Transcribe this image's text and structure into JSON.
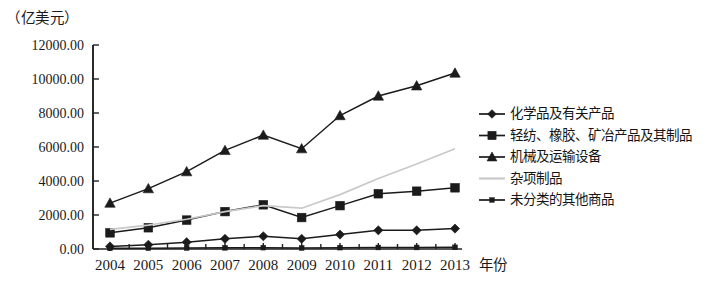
{
  "axis": {
    "unit_label": "（亿美元）",
    "xlabel": "年份",
    "ytick_labels": [
      "0.00",
      "2000.00",
      "4000.00",
      "6000.00",
      "8000.00",
      "10000.00",
      "12000.00"
    ],
    "xtick_labels": [
      "2004",
      "2005",
      "2006",
      "2007",
      "2008",
      "2009",
      "2010",
      "2011",
      "2012",
      "2013"
    ]
  },
  "legend": {
    "items": [
      {
        "label": "化学品及有关产品",
        "marker": "diamond-marker",
        "color": "#1b1b1b"
      },
      {
        "label": "轻纺、橡胶、矿冶产品及其制品",
        "marker": "square-marker",
        "color": "#1b1b1b"
      },
      {
        "label": "机械及运输设备",
        "marker": "triangle-marker",
        "color": "#1b1b1b"
      },
      {
        "label": "杂项制品",
        "marker": "line-marker",
        "color": "#c9c9c9"
      },
      {
        "label": "未分类的其他商品",
        "marker": "small-square-marker",
        "color": "#1b1b1b"
      }
    ]
  },
  "chart_data": {
    "type": "line",
    "title": "",
    "subtitle": "",
    "xlabel": "年份",
    "ylabel": "（亿美元）",
    "x": [
      "2004",
      "2005",
      "2006",
      "2007",
      "2008",
      "2009",
      "2010",
      "2011",
      "2012",
      "2013"
    ],
    "categories": [
      "2004",
      "2005",
      "2006",
      "2007",
      "2008",
      "2009",
      "2010",
      "2011",
      "2012",
      "2013"
    ],
    "ylim": [
      0,
      12000
    ],
    "ytick_values": [
      0,
      2000,
      4000,
      6000,
      8000,
      10000,
      12000
    ],
    "grid": false,
    "legend_position": "right",
    "series": [
      {
        "name": "化学品及有关产品",
        "marker": "diamond",
        "color": "#1b1b1b",
        "values": [
          150,
          250,
          400,
          600,
          750,
          600,
          850,
          1100,
          1100,
          1200
        ]
      },
      {
        "name": "轻纺、橡胶、矿冶产品及其制品",
        "marker": "square",
        "color": "#1b1b1b",
        "values": [
          950,
          1250,
          1700,
          2200,
          2600,
          1850,
          2550,
          3250,
          3400,
          3600
        ]
      },
      {
        "name": "机械及运输设备",
        "marker": "triangle",
        "color": "#1b1b1b",
        "values": [
          2700,
          3550,
          4550,
          5800,
          6700,
          5900,
          7850,
          9000,
          9600,
          10350
        ]
      },
      {
        "name": "杂项制品",
        "marker": "none",
        "color": "#c9c9c9",
        "values": [
          1150,
          1400,
          1750,
          2200,
          2550,
          2400,
          3200,
          4150,
          5000,
          5900
        ]
      },
      {
        "name": "未分类的其他商品",
        "marker": "small-square",
        "color": "#1b1b1b",
        "values": [
          40,
          50,
          60,
          70,
          80,
          60,
          80,
          90,
          90,
          100
        ]
      }
    ]
  }
}
